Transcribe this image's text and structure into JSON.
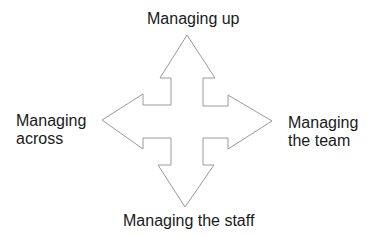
{
  "diagram": {
    "type": "four-way-arrow",
    "stroke_color": "#9a9a9a",
    "fill_color": "#ffffff",
    "labels": {
      "up": {
        "lines": [
          "Managing up"
        ]
      },
      "across": {
        "lines": [
          "Managing",
          "across"
        ]
      },
      "team": {
        "lines": [
          "Managing",
          "the team"
        ]
      },
      "staff": {
        "lines": [
          "Managing the staff"
        ]
      }
    }
  }
}
